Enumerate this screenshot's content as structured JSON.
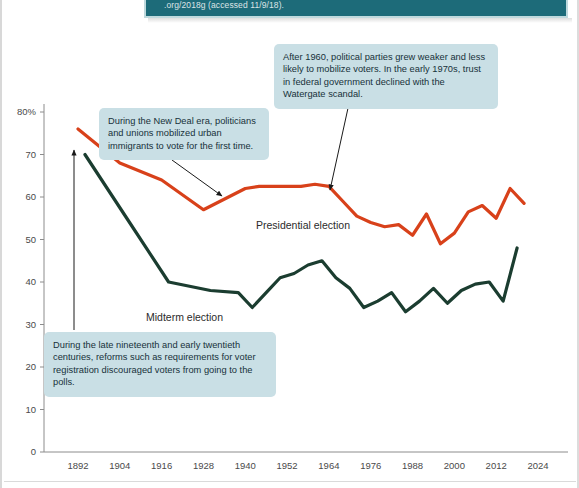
{
  "citation": {
    "line1": "Source: United States Elections Project, November 7, 2018, www.electproject",
    "line2": ".org/2018g (accessed 11/9/18)."
  },
  "chart_data": {
    "type": "line",
    "title": "",
    "xlabel": "",
    "ylabel": "",
    "xlim": [
      1892,
      2024
    ],
    "ylim": [
      0,
      80
    ],
    "grid": false,
    "legend": "inline-labels",
    "y_ticks": [
      "0",
      "10",
      "20",
      "30",
      "40",
      "50",
      "60",
      "70",
      "80%"
    ],
    "y_tick_values": [
      0,
      10,
      20,
      30,
      40,
      50,
      60,
      70,
      80
    ],
    "x_ticks": [
      "1892",
      "1904",
      "1916",
      "1928",
      "1940",
      "1952",
      "1964",
      "1976",
      "1988",
      "2000",
      "2012",
      "2024"
    ],
    "x_tick_values": [
      1892,
      1904,
      1916,
      1928,
      1940,
      1952,
      1964,
      1976,
      1988,
      2000,
      2012,
      2024
    ],
    "series": [
      {
        "name": "Presidential election",
        "color": "#d8411a",
        "x": [
          1892,
          1904,
          1916,
          1928,
          1940,
          1944,
          1948,
          1952,
          1956,
          1960,
          1964,
          1968,
          1972,
          1976,
          1980,
          1984,
          1988,
          1992,
          1996,
          2000,
          2004,
          2008,
          2012,
          2016,
          2020
        ],
        "values": [
          76,
          68,
          64,
          57,
          62,
          62.5,
          62.5,
          62.5,
          62.5,
          63,
          62.5,
          59,
          55.5,
          54,
          53,
          53.5,
          51,
          56,
          49,
          51.5,
          56.5,
          58,
          55,
          62,
          58.5
        ]
      },
      {
        "name": "Midterm election",
        "color": "#1b3d30",
        "x": [
          1894,
          1906,
          1918,
          1930,
          1938,
          1942,
          1946,
          1950,
          1954,
          1958,
          1962,
          1966,
          1970,
          1974,
          1978,
          1982,
          1986,
          1990,
          1994,
          1998,
          2002,
          2006,
          2010,
          2014,
          2018
        ],
        "values": [
          70,
          55,
          40,
          38,
          37.5,
          34,
          37.5,
          41,
          42,
          44,
          45,
          41,
          38.5,
          34,
          35.5,
          37.5,
          33,
          35.5,
          38.5,
          35,
          38,
          39.5,
          40,
          35.5,
          48
        ]
      }
    ],
    "series_label_positions": [
      {
        "label": "Presidential election",
        "x": 256,
        "y": 219
      },
      {
        "label": "Midterm election",
        "x": 146,
        "y": 311
      }
    ],
    "annotations": [
      {
        "id": "callout-newdeal",
        "text": "During the New Deal era, politicians and unions mobilized urban immigrants to vote for the first time."
      },
      {
        "id": "callout-after1960",
        "text": "After 1960, political parties grew weaker and less likely to mobilize voters. In the early 1970s, trust in federal government declined with the Watergate scandal."
      },
      {
        "id": "callout-reforms",
        "text": "During the late nineteenth and early twentieth centuries, reforms such as requirements for voter registration discouraged voters from going to the polls."
      }
    ]
  },
  "colors": {
    "presidential": "#d8411a",
    "midterm": "#1b3d30",
    "callout_bg": "#c9dfe5",
    "banner_bg": "#1d6b79",
    "axis": "#8c8c8c"
  }
}
